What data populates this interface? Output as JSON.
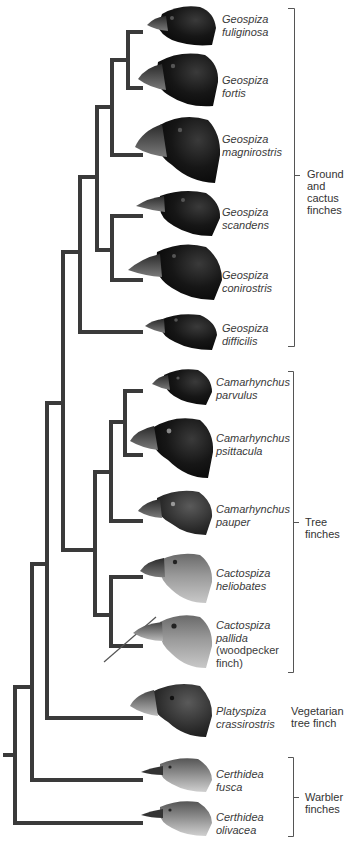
{
  "figure": {
    "type": "phylogenetic-tree",
    "colors": {
      "branch": "#3a3a3a",
      "bracket": "#555555",
      "label_text": "#3a3a3a",
      "dark_bird": "#141414",
      "light_bird": "#8a8a8a"
    }
  },
  "species": [
    {
      "genus": "Geospiza",
      "epithet": "fuliginosa"
    },
    {
      "genus": "Geospiza",
      "epithet": "fortis"
    },
    {
      "genus": "Geospiza",
      "epithet": "magnirostris"
    },
    {
      "genus": "Geospiza",
      "epithet": "scandens"
    },
    {
      "genus": "Geospiza",
      "epithet": "conirostris"
    },
    {
      "genus": "Geospiza",
      "epithet": "difficilis"
    },
    {
      "genus": "Camarhynchus",
      "epithet": "parvulus"
    },
    {
      "genus": "Camarhynchus",
      "epithet": "psittacula"
    },
    {
      "genus": "Camarhynchus",
      "epithet": "pauper"
    },
    {
      "genus": "Cactospiza",
      "epithet": "heliobates"
    },
    {
      "genus": "Cactospiza",
      "epithet": "pallida",
      "note_line1": "(woodpecker",
      "note_line2": "finch)"
    },
    {
      "genus": "Platyspiza",
      "epithet": "crassirostris"
    },
    {
      "genus": "Certhidea",
      "epithet": "fusca"
    },
    {
      "genus": "Certhidea",
      "epithet": "olivacea"
    }
  ],
  "groups": [
    {
      "line1": "Ground",
      "line2": "and",
      "line3": "cactus",
      "line4": "finches"
    },
    {
      "line1": "Tree",
      "line2": "finches"
    },
    {
      "line1": "Vegetarian",
      "line2": "tree finch"
    },
    {
      "line1": "Warbler",
      "line2": "finches"
    }
  ]
}
